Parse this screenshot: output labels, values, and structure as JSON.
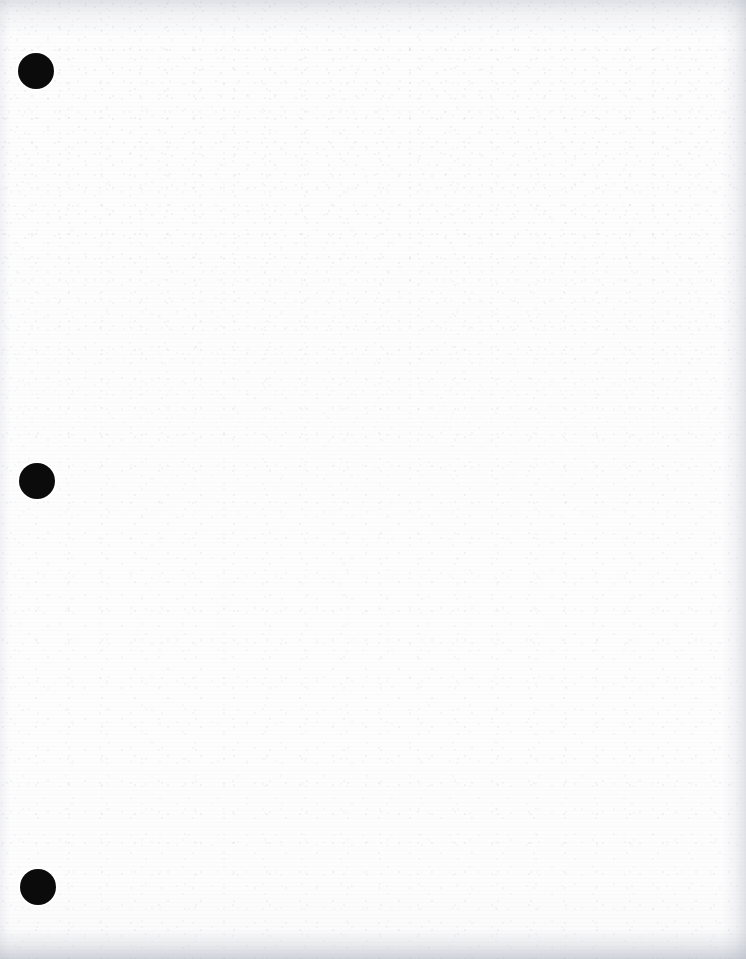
{
  "document": {
    "type": "scanned-blank-page",
    "page_width": 746,
    "page_height": 959,
    "paper_color": "#fdfdfe",
    "ink_color": "#0b0b0b",
    "visible_text": "",
    "description": "Blank scanned sheet of three-hole-punched paper"
  },
  "punch_holes": [
    {
      "name": "punch-hole-top",
      "cx": 36,
      "cy": 71,
      "r": 18,
      "color": "#0b0b0b"
    },
    {
      "name": "punch-hole-middle",
      "cx": 37,
      "cy": 481,
      "r": 18,
      "color": "#0b0b0b"
    },
    {
      "name": "punch-hole-bottom",
      "cx": 38,
      "cy": 887,
      "r": 18,
      "color": "#0b0b0b"
    }
  ],
  "edges": {
    "top_shadow": "#b0b4c0",
    "right_shadow": "#aaafbc",
    "bottom_shadow": "#a8adba",
    "left_shadow": "#b4b8c4"
  },
  "texture": {
    "grain_color": "#969cac",
    "streak_color": "#a8acba"
  }
}
